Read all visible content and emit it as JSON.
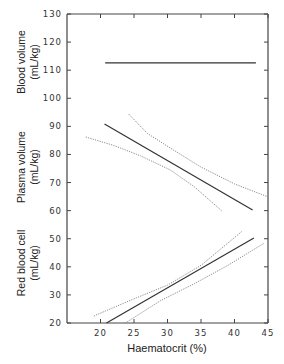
{
  "chart_data": {
    "type": "line",
    "title": "",
    "xlabel": "Haematocrit (%)",
    "ylabel_panels": [
      {
        "id": "blood",
        "lines": [
          "Blood volume",
          "(mL/kg)"
        ]
      },
      {
        "id": "plasma",
        "lines": [
          "Plasma volume",
          "(mL/kg)"
        ]
      },
      {
        "id": "rbc",
        "lines": [
          "Red blood cell",
          "(mL/kg)"
        ]
      }
    ],
    "xlim": [
      15,
      45
    ],
    "ylim": [
      20,
      130
    ],
    "x_ticks": [
      20,
      25,
      30,
      35,
      40,
      45
    ],
    "y_ticks": [
      20,
      30,
      40,
      50,
      60,
      70,
      80,
      90,
      100,
      110,
      120,
      130
    ],
    "grid": false,
    "legend": "none",
    "series": [
      {
        "name": "Blood volume regression",
        "style": "solid",
        "color": "#333333",
        "points": [
          [
            20.7,
            112.6
          ],
          [
            43.2,
            112.6
          ]
        ]
      },
      {
        "name": "Plasma volume regression",
        "style": "solid",
        "color": "#333333",
        "points": [
          [
            20.6,
            90.8
          ],
          [
            42.7,
            60.2
          ]
        ]
      },
      {
        "name": "Plasma volume 95% CI upper",
        "style": "dotted",
        "color": "#8a8a8a",
        "points": [
          [
            24.2,
            94.4
          ],
          [
            27.0,
            87.5
          ],
          [
            30.4,
            82.3
          ],
          [
            35.0,
            75.5
          ],
          [
            40.0,
            69.5
          ],
          [
            45.0,
            64.9
          ]
        ]
      },
      {
        "name": "Plasma volume 95% CI lower",
        "style": "dotted",
        "color": "#8a8a8a",
        "points": [
          [
            17.8,
            86.2
          ],
          [
            22.0,
            83.2
          ],
          [
            26.0,
            79.5
          ],
          [
            30.4,
            74.5
          ],
          [
            34.0,
            68.5
          ],
          [
            38.1,
            59.9
          ]
        ]
      },
      {
        "name": "Red blood cell regression",
        "style": "solid",
        "color": "#333333",
        "points": [
          [
            20.9,
            20.0
          ],
          [
            42.9,
            50.3
          ]
        ]
      },
      {
        "name": "Red blood cell 95% CI upper",
        "style": "dotted",
        "color": "#8a8a8a",
        "points": [
          [
            19.0,
            22.5
          ],
          [
            25.0,
            28.6
          ],
          [
            30.0,
            33.5
          ],
          [
            35.0,
            40.5
          ],
          [
            41.2,
            52.8
          ]
        ]
      },
      {
        "name": "Red blood cell 95% CI lower",
        "style": "dotted",
        "color": "#8a8a8a",
        "points": [
          [
            23.7,
            20.0
          ],
          [
            29.0,
            28.0
          ],
          [
            34.0,
            34.0
          ],
          [
            39.0,
            40.5
          ],
          [
            44.5,
            48.5
          ]
        ]
      }
    ]
  },
  "labels": {
    "xlabel": "Haematocrit (%)",
    "blood_1": "Blood volume",
    "blood_2": "(mL/kg)",
    "plasma_1": "Plasma volume",
    "plasma_2": "(mL/kg)",
    "rbc_1": "Red blood cell",
    "rbc_2": "(mL/kg)"
  }
}
